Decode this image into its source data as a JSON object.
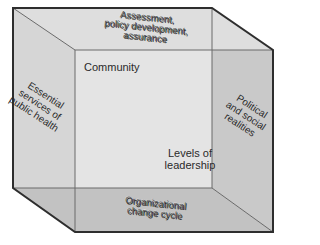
{
  "diagram": {
    "type": "3D cube framework",
    "faces": {
      "top": "Assessment,\npolicy development,\nassurance",
      "left": "Essential\nservices of\npublic health",
      "right": "Political\nand social\nrealities",
      "bottom": "Organizational\nchange cycle",
      "back_top_left": "Community",
      "back_bottom_right": "Levels of\nleadership"
    },
    "colors": {
      "back_face": "#e4e4e4",
      "top_face": "#dedede",
      "left_face": "#d6d6d6",
      "right_face": "#c9c9c9",
      "bottom_face": "#c2c2c2",
      "edge": "#2e2e2e"
    }
  }
}
